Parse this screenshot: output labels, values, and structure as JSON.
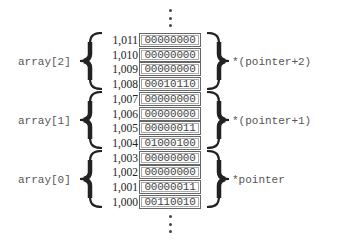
{
  "diagram": {
    "type": "memory-layout",
    "continuation_marker": "⋮",
    "cells": [
      {
        "address": "1,011",
        "bits": "00000000"
      },
      {
        "address": "1,010",
        "bits": "00000000"
      },
      {
        "address": "1,009",
        "bits": "00000000"
      },
      {
        "address": "1,008",
        "bits": "00010110"
      },
      {
        "address": "1,007",
        "bits": "00000000"
      },
      {
        "address": "1,006",
        "bits": "00000000"
      },
      {
        "address": "1,005",
        "bits": "00000011"
      },
      {
        "address": "1,004",
        "bits": "01000100"
      },
      {
        "address": "1,003",
        "bits": "00000000"
      },
      {
        "address": "1,002",
        "bits": "00000000"
      },
      {
        "address": "1,001",
        "bits": "00000011"
      },
      {
        "address": "1,000",
        "bits": "00110010"
      }
    ],
    "groups": [
      {
        "array_label": "array[2]",
        "pointer_label": "*(pointer+2)"
      },
      {
        "array_label": "array[1]",
        "pointer_label": "*(pointer+1)"
      },
      {
        "array_label": "array[0]",
        "pointer_label": "*pointer"
      }
    ]
  }
}
